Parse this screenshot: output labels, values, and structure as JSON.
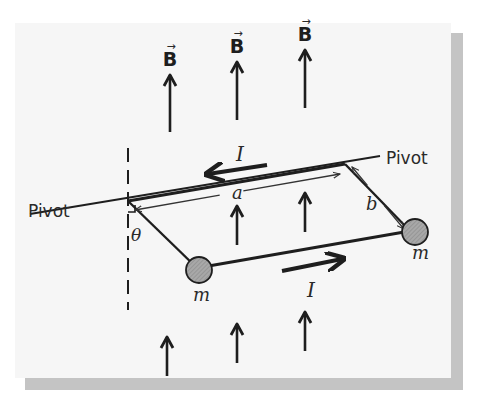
{
  "colors": {
    "background": "#ffffff",
    "panel": "#f6f6f6",
    "shadow": "#c4c4c4",
    "ink": "#1e1e1e",
    "thin_ink": "#333333",
    "mass_fill": "#9a9a9a"
  },
  "labels": {
    "pivot_left": "Pivot",
    "pivot_right": "Pivot",
    "current_top": "I",
    "current_bottom": "I",
    "side_a": "a",
    "side_b": "b",
    "angle": "θ",
    "mass_left": "m",
    "mass_right": "m",
    "field": "B",
    "field_vector_mark": "→"
  },
  "field_arrows": {
    "labeled": [
      {
        "x": 170,
        "y_top": 75,
        "y_bottom": 132,
        "label_y": 66
      },
      {
        "x": 237,
        "y_top": 62,
        "y_bottom": 120,
        "label_y": 53
      },
      {
        "x": 305,
        "y_top": 50,
        "y_bottom": 108,
        "label_y": 41
      }
    ],
    "middle": [
      {
        "x": 237,
        "y_top": 206,
        "y_bottom": 245
      },
      {
        "x": 305,
        "y_top": 193,
        "y_bottom": 232
      }
    ],
    "bottom": [
      {
        "x": 167,
        "y_top": 337,
        "y_bottom": 376
      },
      {
        "x": 237,
        "y_top": 324,
        "y_bottom": 363
      },
      {
        "x": 305,
        "y_top": 312,
        "y_bottom": 351
      }
    ]
  },
  "geometry": {
    "pivot_axis": {
      "x1": 30,
      "y1": 214,
      "x2": 380,
      "y2": 156
    },
    "top_wire": {
      "x1": 128,
      "y1": 201,
      "x2": 345,
      "y2": 164
    },
    "left_rod": {
      "x1": 128,
      "y1": 201,
      "x2": 197,
      "y2": 268
    },
    "right_rod": {
      "x1": 345,
      "y1": 164,
      "x2": 410,
      "y2": 231
    },
    "bottom_wire": {
      "x1": 197,
      "y1": 268,
      "x2": 410,
      "y2": 231
    },
    "mass_left": {
      "cx": 199,
      "cy": 270,
      "r": 13
    },
    "mass_right": {
      "cx": 415,
      "cy": 232,
      "r": 13
    },
    "vertical_dashed": {
      "x": 128,
      "y1": 148,
      "y2": 310
    },
    "a_dimension": {
      "x1": 135,
      "y1": 210,
      "x2": 340,
      "y2": 174,
      "label_x": 232,
      "label_y": 199
    },
    "b_dimension": {
      "x1": 352,
      "y1": 167,
      "x2": 404,
      "y2": 229,
      "label_x": 366,
      "label_y": 210
    },
    "current_top_arrow": {
      "x1": 267,
      "y1": 165,
      "x2": 208,
      "y2": 174,
      "label_x": 236,
      "label_y": 161
    },
    "current_bottom_arrow": {
      "x1": 282,
      "y1": 271,
      "x2": 342,
      "y2": 259,
      "label_x": 307,
      "label_y": 297
    },
    "pivot_left_label": {
      "x": 30,
      "y": 217
    },
    "pivot_right_label": {
      "x": 386,
      "y": 164
    },
    "angle_label": {
      "x": 131,
      "y": 241
    },
    "mass_left_label": {
      "x": 193,
      "y": 301
    },
    "mass_right_label": {
      "x": 412,
      "y": 259
    }
  }
}
